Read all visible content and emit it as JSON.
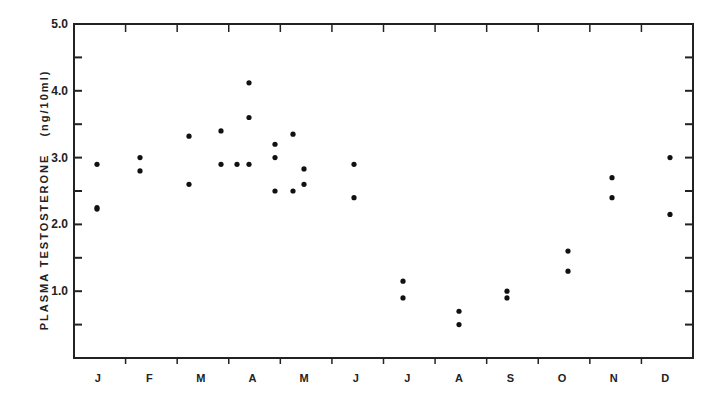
{
  "chart_data": {
    "type": "scatter",
    "title": "",
    "xlabel": "",
    "ylabel": "PLASMA  TESTOSTERONE  (ng/10ml)",
    "ylabel_main": "PLASMA   TESTOSTERONE",
    "ylabel_units": "(ng/10ml)",
    "ylim": [
      0,
      5.0
    ],
    "y_ticks": [
      {
        "value": 1.0,
        "label": "1.0"
      },
      {
        "value": 2.0,
        "label": "2.0"
      },
      {
        "value": 3.0,
        "label": "3.0"
      },
      {
        "value": 4.0,
        "label": "4.0"
      },
      {
        "value": 5.0,
        "label": "5.0"
      }
    ],
    "y_minor_ticks": [
      0.5,
      1.5,
      2.5,
      3.5,
      4.5
    ],
    "categories": [
      "J",
      "F",
      "M",
      "A",
      "M",
      "J",
      "J",
      "A",
      "S",
      "O",
      "N",
      "D"
    ],
    "grid": false,
    "legend": null,
    "points": [
      {
        "month": "J",
        "x": 97,
        "y": 2.9
      },
      {
        "month": "J",
        "x": 97,
        "y": 2.25
      },
      {
        "month": "J",
        "x": 97,
        "y": 2.23
      },
      {
        "month": "F",
        "x": 140,
        "y": 3.0
      },
      {
        "month": "F",
        "x": 140,
        "y": 2.8
      },
      {
        "month": "M",
        "x": 189,
        "y": 3.32
      },
      {
        "month": "M",
        "x": 189,
        "y": 2.6
      },
      {
        "month": "M",
        "x": 221,
        "y": 3.4
      },
      {
        "month": "M",
        "x": 221,
        "y": 2.9
      },
      {
        "month": "A",
        "x": 237,
        "y": 2.9
      },
      {
        "month": "A",
        "x": 249,
        "y": 4.12
      },
      {
        "month": "A",
        "x": 249,
        "y": 3.6
      },
      {
        "month": "A",
        "x": 249,
        "y": 2.9
      },
      {
        "month": "A",
        "x": 275,
        "y": 3.2
      },
      {
        "month": "A",
        "x": 275,
        "y": 3.0
      },
      {
        "month": "A",
        "x": 275,
        "y": 2.5
      },
      {
        "month": "M",
        "x": 293,
        "y": 3.35
      },
      {
        "month": "M",
        "x": 293,
        "y": 2.5
      },
      {
        "month": "M",
        "x": 304,
        "y": 2.83
      },
      {
        "month": "M",
        "x": 304,
        "y": 2.6
      },
      {
        "month": "J",
        "x": 354,
        "y": 2.9
      },
      {
        "month": "J",
        "x": 354,
        "y": 2.4
      },
      {
        "month": "J",
        "x": 403,
        "y": 1.15
      },
      {
        "month": "J",
        "x": 403,
        "y": 0.9
      },
      {
        "month": "A",
        "x": 459,
        "y": 0.7
      },
      {
        "month": "A",
        "x": 459,
        "y": 0.5
      },
      {
        "month": "S",
        "x": 507,
        "y": 1.0
      },
      {
        "month": "S",
        "x": 507,
        "y": 0.9
      },
      {
        "month": "O",
        "x": 568,
        "y": 1.6
      },
      {
        "month": "O",
        "x": 568,
        "y": 1.3
      },
      {
        "month": "N",
        "x": 612,
        "y": 2.7
      },
      {
        "month": "N",
        "x": 612,
        "y": 2.4
      },
      {
        "month": "D",
        "x": 670,
        "y": 3.0
      },
      {
        "month": "D",
        "x": 670,
        "y": 2.15
      }
    ]
  }
}
